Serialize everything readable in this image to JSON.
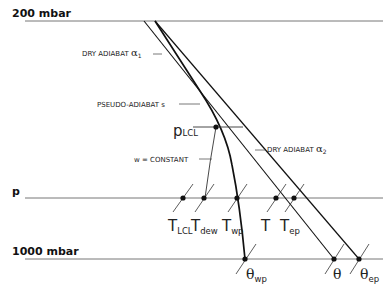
{
  "diagram": {
    "levels": {
      "top": {
        "label": "200 mbar",
        "y": 21
      },
      "p": {
        "label": "p",
        "y": 198
      },
      "bottom": {
        "label": "1000 mbar",
        "y": 259
      }
    },
    "curves": {
      "dry_adiabat_1": {
        "label": "DRY ADIABAT",
        "symbol": "α",
        "subscript": "1"
      },
      "pseudo_adiabat": {
        "label": "PSEUDO-ADIABAT s"
      },
      "dry_adiabat_2": {
        "label": "DRY ADIABAT",
        "symbol": "α",
        "subscript": "2"
      },
      "mixing_ratio": {
        "label": "w = CONSTANT"
      }
    },
    "lcl": {
      "main": "p",
      "subscript": "LCL"
    },
    "p_level_points": [
      {
        "main": "T",
        "subscript": "LCL"
      },
      {
        "main": "T",
        "subscript": "dew"
      },
      {
        "main": "T",
        "subscript": "wp"
      },
      {
        "main": "T",
        "subscript": ""
      },
      {
        "main": "T",
        "subscript": "ep"
      }
    ],
    "surface_points": [
      {
        "main": "θ",
        "subscript": "wp"
      },
      {
        "main": "θ",
        "subscript": ""
      },
      {
        "main": "θ",
        "subscript": "ep"
      }
    ],
    "colors": {
      "line": "#111111",
      "level_line": "#777777",
      "background": "#ffffff"
    }
  }
}
